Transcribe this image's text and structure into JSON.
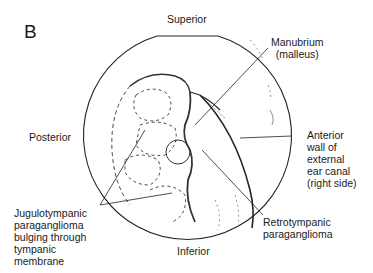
{
  "figure": {
    "panel_letter": "B",
    "orientation": {
      "top": "Superior",
      "bottom": "Inferior",
      "left": "Posterior"
    },
    "labels": [
      {
        "id": "manubrium",
        "text": "Manubrium\n(malleus)"
      },
      {
        "id": "anterior-wall",
        "text": "Anterior\nwall of\nexternal\near canal\n(right side)"
      },
      {
        "id": "retrotympanic",
        "text": "Retrotympanic\nparaganglioma"
      },
      {
        "id": "jugulotympanic",
        "text": "Jugulotympanic\nparaganglioma\nbulging through\ntympanic\nmembrane"
      }
    ]
  }
}
